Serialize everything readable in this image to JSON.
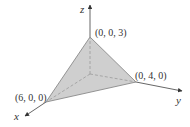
{
  "figure": {
    "type": "3d-plane-tetrahedron",
    "axes": {
      "x": {
        "label": "x"
      },
      "y": {
        "label": "y"
      },
      "z": {
        "label": "z"
      }
    },
    "vertices": [
      {
        "id": "z-intercept",
        "label": "(0, 0, 3)"
      },
      {
        "id": "y-intercept",
        "label": "(0, 4, 0)"
      },
      {
        "id": "x-intercept",
        "label": "(6, 0, 0)"
      }
    ],
    "colors": {
      "face_fill": "#cfcfcf",
      "edge": "#8a8a8a",
      "axis": "#555555",
      "dashed": "#9a9a9a",
      "text": "#333333"
    }
  }
}
